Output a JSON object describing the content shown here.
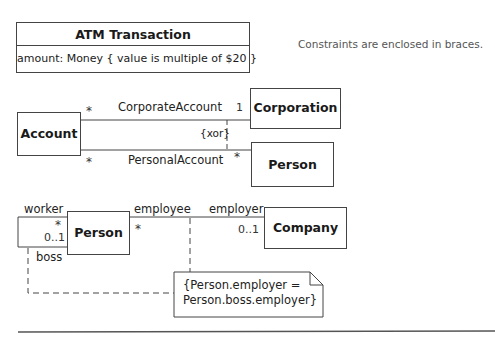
{
  "hint": "Constraints are enclosed in braces.",
  "atm": {
    "class_name": "ATM Transaction",
    "attribute": "amount: Money { value is multiple of $20 }"
  },
  "xor_example": {
    "classes": {
      "account": "Account",
      "corporation": "Corporation",
      "person": "Person"
    },
    "associations": {
      "corporate": {
        "name": "CorporateAccount",
        "mult_account": "*",
        "mult_corporation": "1"
      },
      "personal": {
        "name": "PersonalAccount",
        "mult_account": "*",
        "mult_person": "*"
      }
    },
    "constraint": "{xor}"
  },
  "employment_example": {
    "classes": {
      "person": "Person",
      "company": "Company"
    },
    "self_association": {
      "role_worker": "worker",
      "mult_worker": "*",
      "role_boss": "boss",
      "mult_boss": "0..1"
    },
    "association": {
      "role_employee": "employee",
      "mult_employee": "*",
      "role_employer": "employer",
      "mult_employer": "0..1"
    },
    "note": {
      "line1": "{Person.employer =",
      "line2": "Person.boss.employer}"
    }
  },
  "colors": {
    "line": "#444444",
    "text": "#1a1a1a",
    "hint_text": "#555555"
  }
}
